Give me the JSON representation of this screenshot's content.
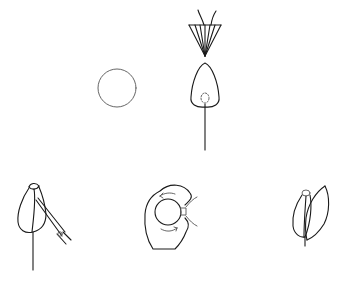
{
  "diagram": {
    "type": "botanical line illustration",
    "figures": [
      {
        "id": "pollen-grain",
        "shape": "circle",
        "center": [
          117,
          88
        ],
        "radius": 19
      },
      {
        "id": "pollination-cone-and-ovule",
        "parts": [
          "cone with radiating ribs",
          "two stigma filaments",
          "teardrop ovule",
          "dashed inner sac",
          "stalk"
        ]
      },
      {
        "id": "bud-with-instrument",
        "parts": [
          "closed bud",
          "stem",
          "diagonal needle/forceps tool"
        ]
      },
      {
        "id": "cross-section-with-rotation",
        "parts": [
          "pear-shaped outline",
          "inner circle",
          "curved arrows indicating rotation",
          "side attachment"
        ]
      },
      {
        "id": "opening-bud",
        "parts": [
          "two petals",
          "tip cap",
          "short stem"
        ]
      }
    ],
    "stroke_color": "#1a1a1a",
    "background": "#ffffff"
  }
}
